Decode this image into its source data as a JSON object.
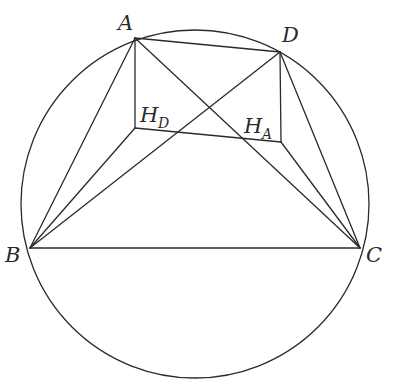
{
  "diagram": {
    "type": "geometry",
    "circle": {
      "cx": 195,
      "cy": 204,
      "r": 174
    },
    "points": {
      "A": {
        "x": 135,
        "y": 38,
        "label": "A"
      },
      "D": {
        "x": 280,
        "y": 52,
        "label": "D"
      },
      "B": {
        "x": 30,
        "y": 248,
        "label": "B"
      },
      "C": {
        "x": 360,
        "y": 248,
        "label": "C"
      },
      "HD": {
        "x": 135,
        "y": 128,
        "label": "H",
        "sub": "D"
      },
      "HA": {
        "x": 281,
        "y": 142,
        "label": "H",
        "sub": "A"
      }
    },
    "segments": [
      [
        "A",
        "D"
      ],
      [
        "B",
        "C"
      ],
      [
        "A",
        "B"
      ],
      [
        "A",
        "C"
      ],
      [
        "D",
        "B"
      ],
      [
        "D",
        "C"
      ],
      [
        "A",
        "HD"
      ],
      [
        "HD",
        "B"
      ],
      [
        "HD",
        "HA"
      ],
      [
        "D",
        "HA"
      ],
      [
        "HA",
        "C"
      ]
    ],
    "colors": {
      "stroke": "#2a2a2a",
      "background": "#ffffff"
    }
  }
}
